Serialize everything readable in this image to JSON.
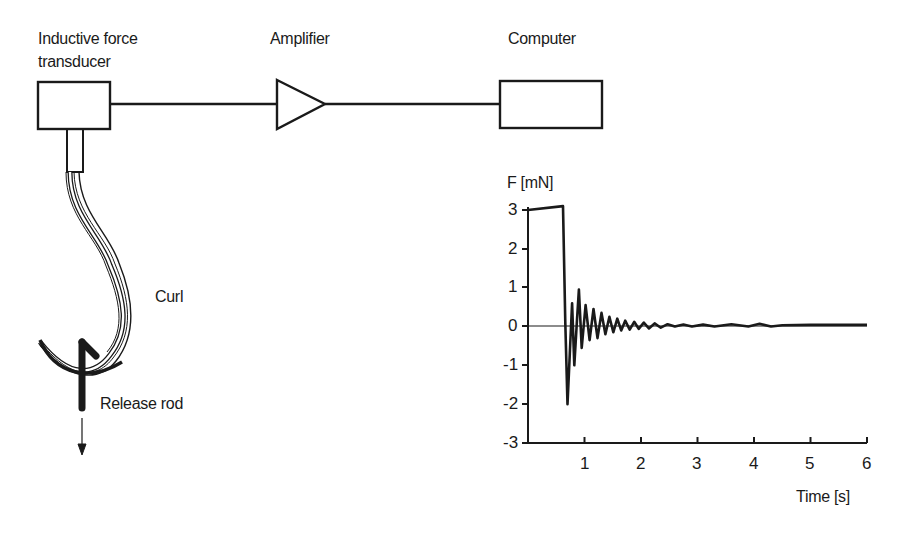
{
  "diagram": {
    "labels": {
      "transducer_line1": "Inductive force",
      "transducer_line2": "transducer",
      "amplifier": "Amplifier",
      "computer": "Computer",
      "curl": "Curl",
      "release_rod": "Release rod"
    },
    "colors": {
      "ink": "#1a1a1a",
      "background": "#ffffff"
    }
  },
  "chart_data": {
    "type": "line",
    "title": "",
    "xlabel": "Time [s]",
    "ylabel": "F [mN]",
    "xlim": [
      0,
      6
    ],
    "ylim": [
      -3,
      3
    ],
    "x_ticks": [
      "1",
      "2",
      "3",
      "4",
      "5",
      "6"
    ],
    "y_ticks": [
      "3",
      "2",
      "1",
      "0",
      "-1",
      "-2",
      "-3"
    ],
    "grid": false,
    "zero_line": true,
    "series": [
      {
        "name": "Force",
        "x": [
          0.0,
          0.62,
          0.66,
          0.7,
          0.74,
          0.78,
          0.82,
          0.86,
          0.9,
          0.95,
          1.02,
          1.09,
          1.16,
          1.23,
          1.3,
          1.37,
          1.44,
          1.51,
          1.58,
          1.65,
          1.72,
          1.8,
          1.88,
          1.96,
          2.05,
          2.14,
          2.24,
          2.35,
          2.47,
          2.6,
          2.75,
          2.9,
          3.1,
          3.3,
          3.6,
          3.9,
          4.1,
          4.3,
          4.5,
          5.0,
          6.0
        ],
        "values": [
          3.0,
          3.1,
          0.1,
          -2.0,
          -0.7,
          0.6,
          -1.0,
          0.0,
          0.95,
          -0.55,
          0.55,
          -0.35,
          0.45,
          -0.3,
          0.35,
          -0.2,
          0.25,
          -0.15,
          0.2,
          -0.1,
          0.15,
          -0.08,
          0.12,
          -0.06,
          0.1,
          -0.05,
          0.08,
          -0.03,
          0.06,
          0.0,
          0.05,
          0.0,
          0.05,
          0.0,
          0.06,
          0.0,
          0.07,
          0.0,
          0.03,
          0.04,
          0.04
        ]
      }
    ]
  }
}
